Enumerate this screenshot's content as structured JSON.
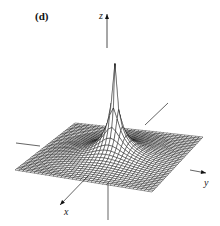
{
  "figure": {
    "panel_label": "(d)",
    "axes": {
      "x": "x",
      "y": "y",
      "z": "z"
    },
    "colors": {
      "line": "#111111",
      "background": "#ffffff"
    },
    "mesh": {
      "grid_lines_per_side": 36
    }
  }
}
